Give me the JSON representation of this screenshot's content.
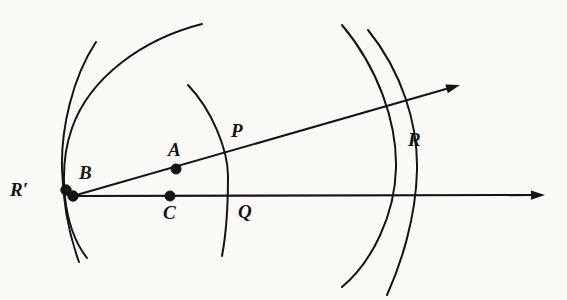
{
  "figure": {
    "width": 567,
    "height": 300,
    "background_color": "#fbfaf7",
    "ink_color": "#141414"
  },
  "labels": [
    {
      "id": "R-prime",
      "text": "R′",
      "x": 10,
      "y": 180,
      "point": {
        "x": 66,
        "y": 190
      }
    },
    {
      "id": "B",
      "text": "B",
      "x": 79,
      "y": 163,
      "point": {
        "x": 73,
        "y": 196
      }
    },
    {
      "id": "A",
      "text": "A",
      "x": 168,
      "y": 140,
      "point": {
        "x": 176,
        "y": 169
      }
    },
    {
      "id": "C",
      "text": "C",
      "x": 163,
      "y": 203,
      "point": {
        "x": 170,
        "y": 196
      }
    },
    {
      "id": "P",
      "text": "P",
      "x": 231,
      "y": 121,
      "point": {
        "x": 228,
        "y": 155
      }
    },
    {
      "id": "Q",
      "text": "Q",
      "x": 238,
      "y": 202,
      "point": {
        "x": 233,
        "y": 196
      }
    },
    {
      "id": "R",
      "text": "R",
      "x": 408,
      "y": 130,
      "point": {
        "x": 404,
        "y": 160
      }
    }
  ],
  "points": [
    {
      "id": "point-R-prime",
      "label": "R′",
      "x": 66,
      "y": 190,
      "radius": 5.2,
      "filled": true
    },
    {
      "id": "point-B",
      "label": "B",
      "x": 73,
      "y": 196,
      "radius": 5.2,
      "filled": true
    },
    {
      "id": "point-A",
      "label": "A",
      "x": 176,
      "y": 169,
      "radius": 5.0,
      "filled": true
    },
    {
      "id": "point-C",
      "label": "C",
      "x": 170,
      "y": 196,
      "radius": 5.0,
      "filled": true
    }
  ],
  "rays": [
    {
      "id": "ray-upper",
      "description": "Ray from B through A and P to arrowhead at upper right",
      "from": {
        "x": 73,
        "y": 196
      },
      "to": {
        "x": 460,
        "y": 85
      },
      "arrowhead": true,
      "passes_through": [
        "B",
        "A",
        "P",
        "R"
      ]
    },
    {
      "id": "ray-horizontal",
      "description": "Horizontal ray from B through C and Q to arrowhead at right",
      "from": {
        "x": 73,
        "y": 196
      },
      "to": {
        "x": 545,
        "y": 195
      },
      "arrowhead": true,
      "passes_through": [
        "B",
        "C",
        "Q"
      ]
    }
  ],
  "arcs": [
    {
      "id": "arc-left-outer",
      "description": "Large outer arc, left of figure, sweeping from bottom-left up and over to upper right",
      "path": "M 87 258 C 62 226 58 168 72 128 C 90 77 143 39 202 24",
      "stroke_width": 2.0
    },
    {
      "id": "arc-left-inner",
      "description": "Inner arc at far left passing near R-prime, from top-left down to bottom-left",
      "path": "M 96 42 C 72 78 61 130 62 168 C 63 206 71 240 79 262",
      "stroke_width": 2.0
    },
    {
      "id": "arc-middle",
      "description": "Middle arc through P and Q, bulging to the right",
      "path": "M 188 85 C 212 110 228 150 228 176 C 228 206 226 235 222 256",
      "stroke_width": 2.0
    },
    {
      "id": "arc-right-inner",
      "description": "Right arc crossing the rays near R, inner of the right pair",
      "path": "M 342 25 C 378 68 397 122 396 168 C 395 215 372 262 342 287",
      "stroke_width": 2.0
    },
    {
      "id": "arc-right-outer",
      "description": "Right arc crossing the rays near R, outer of the right pair",
      "path": "M 368 30 C 402 72 418 124 417 170 C 416 218 401 264 387 295",
      "stroke_width": 2.0
    }
  ]
}
